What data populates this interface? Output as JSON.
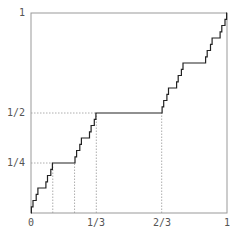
{
  "chart_data": {
    "type": "line",
    "xlabel": "",
    "ylabel": "",
    "xlim": [
      0,
      1
    ],
    "ylim": [
      0,
      1
    ],
    "grid": false,
    "x_ticks": [
      "0",
      "1/3",
      "2/3",
      "1"
    ],
    "y_ticks": [
      "1/4",
      "1/2",
      "1"
    ],
    "guide_lines": [
      {
        "orientation": "horizontal",
        "y": 0.5,
        "x_to": 0.3333
      },
      {
        "orientation": "horizontal",
        "y": 0.25,
        "x_to": 0.1111
      },
      {
        "orientation": "vertical",
        "x": 0.1111,
        "y_to": 0.25
      },
      {
        "orientation": "vertical",
        "x": 0.2222,
        "y_to": 0.25
      },
      {
        "orientation": "vertical",
        "x": 0.3333,
        "y_to": 0.5
      },
      {
        "orientation": "vertical",
        "x": 0.6667,
        "y_to": 0.5
      }
    ],
    "plateaus": [
      {
        "x_start": 0.3333,
        "x_end": 0.6667,
        "y": 0.5
      },
      {
        "x_start": 0.1111,
        "x_end": 0.2222,
        "y": 0.25
      },
      {
        "x_start": 0.7778,
        "x_end": 0.8889,
        "y": 0.75
      }
    ],
    "depth": 5
  },
  "labels": {
    "x0": "0",
    "x13": "1/3",
    "x23": "2/3",
    "x1": "1",
    "y14": "1/4",
    "y12": "1/2",
    "y1": "1"
  },
  "colors": {
    "frame": "#999999",
    "curve": "#222222",
    "guide": "#999999"
  }
}
